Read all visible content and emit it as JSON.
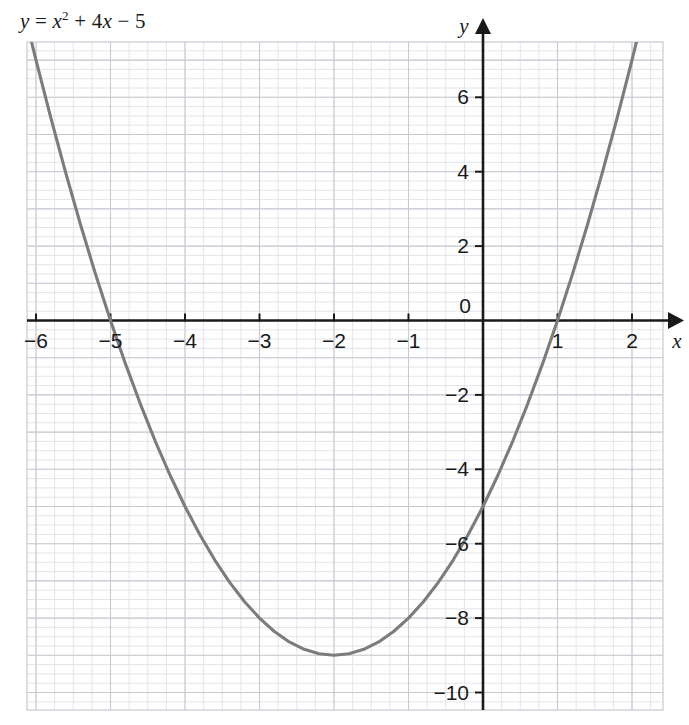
{
  "chart_data": {
    "type": "line",
    "equation_parts": {
      "lhs": "y",
      "eq": "=",
      "x_var": "x",
      "power": "2",
      "plus": "+",
      "coef": "4",
      "x_var2": "x",
      "minus": "−",
      "constant": "5"
    },
    "xlabel": "x",
    "ylabel": "y",
    "xlim": [
      -6.6,
      2.45
    ],
    "ylim": [
      -10.9,
      8.0
    ],
    "xticks": [
      -6,
      -5,
      -4,
      -3,
      -2,
      -1,
      0,
      1,
      2
    ],
    "xtick_labels": [
      "−6",
      "−5",
      "−4",
      "−3",
      "−2",
      "−1",
      "0",
      "1",
      "2"
    ],
    "yticks": [
      6,
      4,
      2,
      -2,
      -4,
      -6,
      -8,
      -10
    ],
    "ytick_labels": [
      "6",
      "4",
      "2",
      "−2",
      "−4",
      "−6",
      "−8",
      "−10"
    ],
    "origin_label": "0",
    "grid": true,
    "grid_minor_step": 0.25,
    "grid_major_step": 1,
    "series": [
      {
        "name": "y = x^2 + 4x - 5",
        "color": "#7c7c7c",
        "x": [
          -6.6,
          -6.4,
          -6.2,
          -6.0,
          -5.8,
          -5.6,
          -5.4,
          -5.2,
          -5.0,
          -4.8,
          -4.6,
          -4.4,
          -4.2,
          -4.0,
          -3.8,
          -3.6,
          -3.4,
          -3.2,
          -3.0,
          -2.8,
          -2.6,
          -2.4,
          -2.2,
          -2.0,
          -1.8,
          -1.6,
          -1.4,
          -1.2,
          -1.0,
          -0.8,
          -0.6,
          -0.4,
          -0.2,
          0.0,
          0.2,
          0.4,
          0.6,
          0.8,
          1.0,
          1.2,
          1.4,
          1.6,
          1.8,
          2.0,
          2.2,
          2.45
        ],
        "y": [
          12.16,
          10.36,
          8.64,
          7.0,
          5.44,
          3.96,
          2.56,
          1.24,
          0.0,
          -1.16,
          -2.24,
          -3.24,
          -4.16,
          -5.0,
          -5.76,
          -6.44,
          -7.04,
          -7.56,
          -8.0,
          -8.36,
          -8.64,
          -8.84,
          -8.96,
          -9.0,
          -8.96,
          -8.84,
          -8.64,
          -8.36,
          -8.0,
          -7.56,
          -7.04,
          -6.44,
          -5.76,
          -5.0,
          -4.16,
          -3.24,
          -2.24,
          -1.16,
          0.0,
          1.24,
          2.56,
          3.96,
          5.44,
          7.0,
          8.64,
          10.6
        ]
      }
    ],
    "key_points": {
      "vertex": [
        -2,
        -9
      ],
      "roots": [
        -5,
        1
      ],
      "y_intercept": -5
    },
    "colors": {
      "curve": "#7c7c7c",
      "axis": "#1a1a1a",
      "grid_major": "#c9c9d2",
      "grid_minor": "#e4e4ec",
      "text": "#1a1a1a",
      "background": "#ffffff"
    }
  }
}
